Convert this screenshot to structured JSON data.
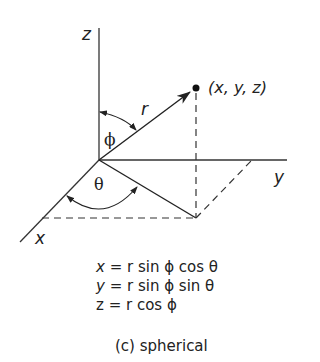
{
  "diagram": {
    "axes": {
      "x_label": "x",
      "y_label": "y",
      "z_label": "z"
    },
    "point_label": "(x, y, z)",
    "radius_label": "r",
    "polar_angle_label": "ϕ",
    "azimuth_angle_label": "θ",
    "equations": {
      "x": {
        "lhs": "x",
        "rhs": "= r sin ϕ cos θ"
      },
      "y": {
        "lhs": "y",
        "rhs": "= r sin ϕ sin θ"
      },
      "z": {
        "lhs": "z",
        "rhs": "= r cos ϕ"
      }
    },
    "caption": "(c) spherical",
    "colors": {
      "ink": "#222222",
      "background": "#ffffff"
    }
  }
}
